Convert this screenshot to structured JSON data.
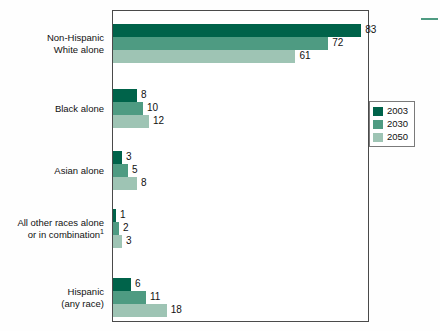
{
  "chart_data": {
    "type": "bar",
    "orientation": "horizontal",
    "title": "",
    "subtitle": "",
    "xlabel": "",
    "ylabel": "",
    "xlim": [
      0,
      100
    ],
    "grid": false,
    "legend_position": "upper-right-inside",
    "categories": [
      "Non-Hispanic\nWhite alone",
      "Black alone",
      "Asian alone",
      "All other races alone\nor in combination",
      "Hispanic\n(any race)"
    ],
    "category_footnote_markers": [
      "",
      "",
      "",
      "1",
      ""
    ],
    "series": [
      {
        "name": "2003",
        "color": "#00634a",
        "values": [
          83,
          8,
          3,
          1,
          6
        ]
      },
      {
        "name": "2030",
        "color": "#4e9b82",
        "values": [
          72,
          10,
          5,
          2,
          11
        ]
      },
      {
        "name": "2050",
        "color": "#9ec4b4",
        "values": [
          61,
          12,
          8,
          3,
          18
        ]
      }
    ],
    "value_labels": [
      [
        "83",
        "72",
        "61"
      ],
      [
        "8",
        "10",
        "12"
      ],
      [
        "3",
        "5",
        "8"
      ],
      [
        "1",
        "2",
        "3"
      ],
      [
        "6",
        "11",
        "18"
      ]
    ]
  },
  "legend": {
    "entries": [
      {
        "label": "2003",
        "color": "#00634a"
      },
      {
        "label": "2030",
        "color": "#4e9b82"
      },
      {
        "label": "2050",
        "color": "#9ec4b4"
      }
    ]
  },
  "colors": {
    "series_2003": "#00634a",
    "series_2030": "#4e9b82",
    "series_2050": "#9ec4b4",
    "frame": "#4a4a4a",
    "text": "#111111",
    "background": "#fefefe"
  },
  "category_labels": [
    {
      "line1": "Non-Hispanic",
      "line2": "White alone",
      "footnote": ""
    },
    {
      "line1": "Black alone",
      "line2": "",
      "footnote": ""
    },
    {
      "line1": "Asian alone",
      "line2": "",
      "footnote": ""
    },
    {
      "line1": "All other races alone",
      "line2": "or in combination",
      "footnote": "1"
    },
    {
      "line1": "Hispanic",
      "line2": "(any race)",
      "footnote": ""
    }
  ]
}
